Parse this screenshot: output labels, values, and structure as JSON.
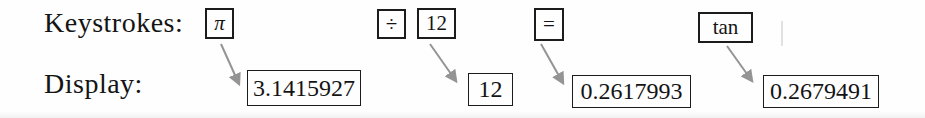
{
  "figure": {
    "keystrokes_label": "Keystrokes:",
    "display_label": "Display:"
  },
  "keys": [
    {
      "label": "π",
      "name": "pi-key"
    },
    {
      "label": "÷",
      "name": "divide-key"
    },
    {
      "label": "12",
      "name": "twelve-key"
    },
    {
      "label": "=",
      "name": "equals-key"
    },
    {
      "label": "tan",
      "name": "tan-key"
    }
  ],
  "displays": [
    {
      "value": "3.1415927",
      "from_key": "π"
    },
    {
      "value": "12",
      "from_key": "12"
    },
    {
      "value": "0.2617993",
      "from_key": "="
    },
    {
      "value": "0.2679491",
      "from_key": "tan"
    }
  ],
  "colors": {
    "arrow": "#949494",
    "box_border": "#1c1c1c",
    "text": "#141414",
    "background": "#fefefe"
  }
}
